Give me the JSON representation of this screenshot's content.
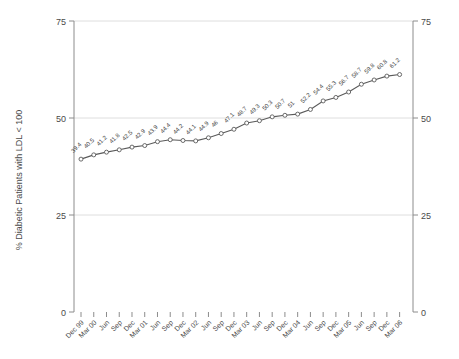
{
  "chart_data": {
    "type": "line",
    "title": "",
    "xlabel": "",
    "ylabel": "% Diabetic Patients with LDL < 100",
    "ylim": [
      0,
      75
    ],
    "yticks": [
      0,
      25,
      50,
      75
    ],
    "y2ticks": [
      0,
      25,
      50,
      75
    ],
    "grid": true,
    "legend": "none",
    "marker": "open-circle",
    "line_color": "#5a5a5a",
    "categories": [
      "Dec 99",
      "Mar 00",
      "Jun",
      "Sep",
      "Dec",
      "Mar 01",
      "Jun",
      "Sep",
      "Dec",
      "Mar 02",
      "Jun",
      "Sep",
      "Dec",
      "Mar 03",
      "Jun",
      "Sep",
      "Dec",
      "Mar 04",
      "Jun",
      "Sep",
      "Dec",
      "Mar 05",
      "Jun",
      "Sep",
      "Dec",
      "Mar 06"
    ],
    "values": [
      39.4,
      40.5,
      41.2,
      41.8,
      42.5,
      42.9,
      43.9,
      44.4,
      44.2,
      44.1,
      44.9,
      46,
      47.1,
      48.7,
      49.3,
      50.3,
      50.7,
      51,
      52.2,
      54.4,
      55.3,
      56.7,
      58.7,
      59.8,
      60.8,
      61.2
    ],
    "point_labels": [
      "39.4",
      "40.5",
      "41.2",
      "41.8",
      "42.5",
      "42.9",
      "43.9",
      "44.4",
      "44.2",
      "44.1",
      "44.9",
      "46",
      "47.1",
      "48.7",
      "49.3",
      "50.3",
      "50.7",
      "51",
      "52.2",
      "54.4",
      "55.3",
      "56.7",
      "58.7",
      "59.8",
      "60.8",
      "61.2"
    ]
  }
}
